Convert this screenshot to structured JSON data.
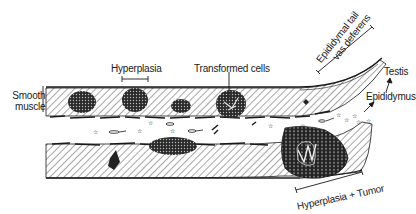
{
  "diagram": {
    "type": "schematic cross-section of epididymal duct",
    "labels": {
      "hyperplasia": "Hyperplasia",
      "transformed_cells": "Transformed cells",
      "epididymal_tail_line1": "Epididymal tail",
      "epididymal_tail_line2": "vas deferens",
      "testis": "Testis",
      "smooth_muscle_line1": "Smooth",
      "smooth_muscle_line2": "muscle",
      "epididymus": "Epididymus",
      "hyperplasia_tumor": "Hyperplasia + Tumor"
    },
    "colors": {
      "ink": "#1a1a1a",
      "background": "#ffffff",
      "hatch": "#3a3a3a"
    }
  }
}
